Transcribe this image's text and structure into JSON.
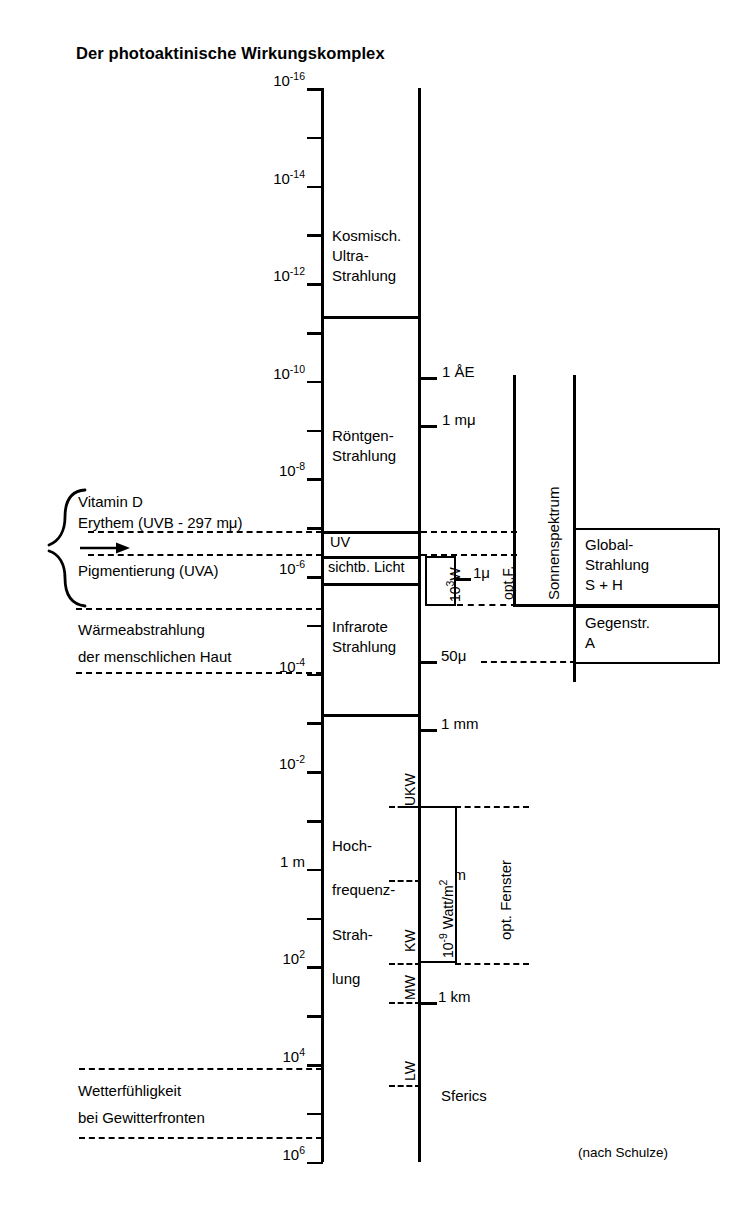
{
  "title": "Der photoaktinische Wirkungskomplex",
  "credit": "(nach Schulze)",
  "axis": {
    "name": "wavelength-scale-cm",
    "tick_labels": [
      {
        "text": "10",
        "exp": "-16"
      },
      {
        "text": "10",
        "exp": "-14"
      },
      {
        "text": "10",
        "exp": "-12"
      },
      {
        "text": "10",
        "exp": "-10"
      },
      {
        "text": "10",
        "exp": "-8"
      },
      {
        "text": "10",
        "exp": "-6"
      },
      {
        "text": "10",
        "exp": "-4"
      },
      {
        "text": "10",
        "exp": "-2"
      },
      {
        "text": "1 m",
        "exp": ""
      },
      {
        "text": "10",
        "exp": "2"
      },
      {
        "text": "10",
        "exp": "4"
      },
      {
        "text": "10",
        "exp": "6"
      }
    ]
  },
  "bands": [
    {
      "id": "kosmisch",
      "lines": [
        "Kosmisch.",
        "Ultra-",
        "Strahlung"
      ]
    },
    {
      "id": "roentgen",
      "lines": [
        "Röntgen-",
        "Strahlung"
      ]
    },
    {
      "id": "uv",
      "lines": [
        "UV"
      ]
    },
    {
      "id": "sichtbares-licht",
      "lines": [
        "sichtb. Licht"
      ]
    },
    {
      "id": "infrarot",
      "lines": [
        "Infrarote",
        "Strahlung"
      ]
    },
    {
      "id": "hochfrequenz",
      "lines": [
        "Hoch-",
        "frequenz-",
        "Strah-",
        "lung"
      ]
    }
  ],
  "right_ticks": [
    {
      "label": "1 ÅE"
    },
    {
      "label": "1 mμ"
    },
    {
      "label": "1μ"
    },
    {
      "label": "50μ"
    },
    {
      "label": "1 mm"
    },
    {
      "label": "1 m"
    },
    {
      "label": "1 km"
    }
  ],
  "radio_bands": [
    "UKW",
    "KW",
    "MW",
    "LW"
  ],
  "sferics_label": "Sferics",
  "vertical_labels": {
    "power_window": "10",
    "power_window_exp": "3",
    "power_window_unit": "W",
    "opt_f": "opt.F.",
    "sonnenspektrum": "Sonnenspektrum",
    "watt_m2": "10",
    "watt_m2_exp": "-9",
    "watt_m2_unit": " Watt/m",
    "watt_m2_unit_exp": "2",
    "opt_fenster": "opt. Fenster"
  },
  "right_boxes": [
    {
      "id": "global-strahlung",
      "lines": [
        "Global-",
        "Strahlung",
        "S + H"
      ]
    },
    {
      "id": "gegenstrahlung",
      "lines": [
        "Gegenstr.",
        "A"
      ]
    }
  ],
  "left_annotations": [
    {
      "id": "vitamin-d",
      "text": "Vitamin D"
    },
    {
      "id": "erythem",
      "text": "Erythem (UVB - 297 mμ)"
    },
    {
      "id": "pigmentierung",
      "text": "Pigmentierung (UVA)"
    },
    {
      "id": "waerme-1",
      "text": "Wärmeabstrahlung"
    },
    {
      "id": "waerme-2",
      "text": "der menschlichen Haut"
    },
    {
      "id": "wetter-1",
      "text": "Wetterfühligkeit"
    },
    {
      "id": "wetter-2",
      "text": "bei Gewitterfronten"
    }
  ],
  "colors": {
    "ink": "#000000",
    "paper": "#ffffff"
  }
}
